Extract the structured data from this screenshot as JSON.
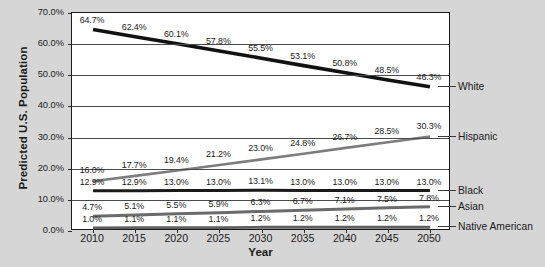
{
  "chart_data": {
    "type": "line",
    "title": "",
    "xlabel": "Year",
    "ylabel": "Predicted U.S. Population",
    "categories": [
      "2010",
      "2015",
      "2020",
      "2025",
      "2030",
      "2035",
      "2040",
      "2045",
      "2050"
    ],
    "ylim": [
      0,
      70
    ],
    "ytick_labels": [
      "0.0%",
      "10.0%",
      "20.0%",
      "30.0%",
      "40.0%",
      "50.0%",
      "60.0%",
      "70.0%"
    ],
    "ytick_values": [
      0,
      10,
      20,
      30,
      40,
      50,
      60,
      70
    ],
    "grid": true,
    "legend_position": "right",
    "series": [
      {
        "name": "White",
        "color": "#111111",
        "width": 3.6,
        "values": [
          64.7,
          62.4,
          60.1,
          57.8,
          55.5,
          53.1,
          50.8,
          48.5,
          46.3
        ],
        "labels": [
          "64.7%",
          "62.4%",
          "60.1%",
          "57.8%",
          "55.5%",
          "53.1%",
          "50.8%",
          "48.5%",
          "46.3%"
        ]
      },
      {
        "name": "Hispanic",
        "color": "#7d7d7d",
        "width": 2.6,
        "values": [
          16.0,
          17.7,
          19.4,
          21.2,
          23.0,
          24.8,
          26.7,
          28.5,
          30.3
        ],
        "labels": [
          "16.0%",
          "17.7%",
          "19.4%",
          "21.2%",
          "23.0%",
          "24.8%",
          "26.7%",
          "28.5%",
          "30.3%"
        ]
      },
      {
        "name": "Black",
        "color": "#1a1a1a",
        "width": 3.0,
        "values": [
          12.9,
          12.9,
          13.0,
          13.0,
          13.1,
          13.0,
          13.0,
          13.0,
          13.0
        ],
        "labels": [
          "12.9%",
          "12.9%",
          "13.0%",
          "13.0%",
          "13.1%",
          "13.0%",
          "13.0%",
          "13.0%",
          "13.0%"
        ]
      },
      {
        "name": "Asian",
        "color": "#6b6b6b",
        "width": 3.0,
        "values": [
          4.7,
          5.1,
          5.5,
          5.9,
          6.3,
          6.7,
          7.1,
          7.5,
          7.8
        ],
        "labels": [
          "4.7%",
          "5.1%",
          "5.5%",
          "5.9%",
          "6.3%",
          "6.7%",
          "7.1%",
          "7.5%",
          "7.8%"
        ]
      },
      {
        "name": "Native American",
        "color": "#5f5f5f",
        "width": 2.8,
        "values": [
          1.0,
          1.1,
          1.1,
          1.1,
          1.2,
          1.2,
          1.2,
          1.2,
          1.2
        ],
        "labels": [
          "1.0%",
          "1.1%",
          "1.1%",
          "1.1%",
          "1.2%",
          "1.2%",
          "1.2%",
          "1.2%",
          "1.2%"
        ]
      }
    ],
    "legend_entries": [
      {
        "label": "White",
        "at_value": 46.3
      },
      {
        "label": "Hispanic",
        "at_value": 30.3
      },
      {
        "label": "Black",
        "at_value": 13.0
      },
      {
        "label": "Asian",
        "at_value": 7.8
      },
      {
        "label": "Native American",
        "at_value": 1.2
      }
    ]
  }
}
